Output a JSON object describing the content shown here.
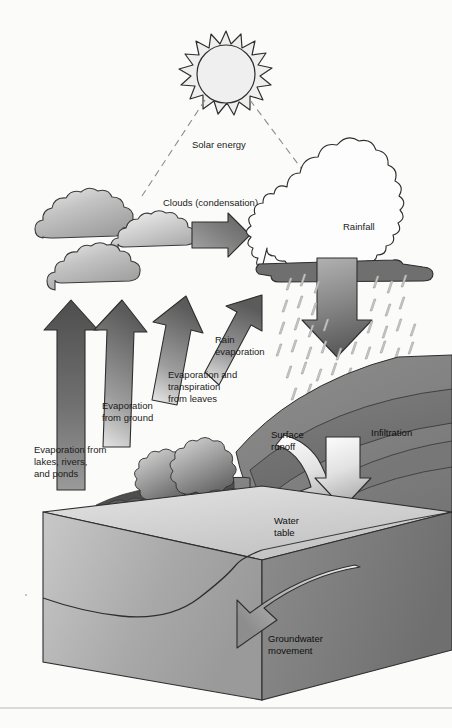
{
  "diagram": {
    "background_color": "#fbfbf9",
    "stroke_color": "#2b2b2b"
  },
  "labels": {
    "solar_energy": "Solar energy",
    "clouds_condensation": "Clouds (condensation)",
    "rainfall": "Rainfall",
    "rain_evaporation_line1": "Rain",
    "rain_evaporation_line2": "evaporation",
    "evap_transpiration_line1": "Evaporation and",
    "evap_transpiration_line2": "transpiration",
    "evap_transpiration_line3": "from leaves",
    "evap_ground_line1": "Evaporation",
    "evap_ground_line2": "from ground",
    "evap_lakes_line1": "Evaporation from",
    "evap_lakes_line2": "lakes, rivers,",
    "evap_lakes_line3": "and ponds",
    "surface_runoff_line1": "Surface",
    "surface_runoff_line2": "runoff",
    "infiltration": "Infiltration",
    "water_table_line1": "Water",
    "water_table_line2": "table",
    "groundwater_line1": "Groundwater",
    "groundwater_line2": "movement"
  },
  "colors": {
    "arrow_dark": "#5a5a5a",
    "arrow_mid": "#8e8e8e",
    "arrow_light": "#d8d8d8",
    "cloud_gray": "#b8b8b8",
    "cloud_white": "#fdfdfd",
    "cloud_base_dark": "#6f6f6f",
    "ground_dark": "#6b6b6b",
    "ground_mid": "#8a8a8a",
    "block_top": "#d6d6d6",
    "block_front": "#a9a9a9",
    "block_side": "#7d7d7d",
    "rain_drop": "#c9c9c9",
    "sun_fill": "#ededed"
  }
}
